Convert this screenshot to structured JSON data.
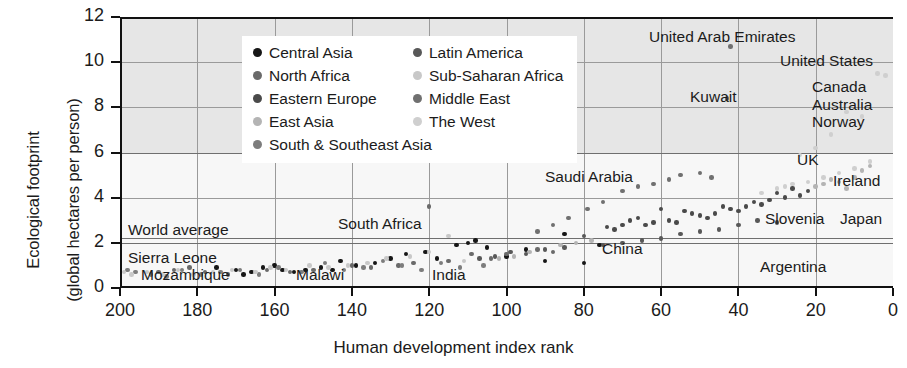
{
  "chart_data": {
    "type": "scatter",
    "title": "",
    "xlabel": "Human development index rank",
    "ylabel": "Ecological footprint\n(global hectares per person)",
    "ylabel_line1": "Ecological footprint",
    "ylabel_line2": "(global hectares per person)",
    "xlim": [
      200,
      0
    ],
    "ylim": [
      0,
      12
    ],
    "x_reversed": true,
    "xticks": [
      200,
      180,
      160,
      140,
      120,
      100,
      80,
      60,
      40,
      20,
      0
    ],
    "yticks": [
      0,
      2,
      4,
      6,
      8,
      10,
      12
    ],
    "grid": "both",
    "legend_position": "top-left-inside",
    "shaded_band": {
      "from": 6,
      "to": 12,
      "color": "#e6e6e6"
    },
    "reference_lines": [
      {
        "label": "World average",
        "y": 2.2
      }
    ],
    "series": [
      {
        "name": "Central Asia",
        "color": "#161616",
        "points": [
          [
            110,
            2.0
          ],
          [
            113,
            1.9
          ],
          [
            126,
            1.5
          ],
          [
            130,
            1.3
          ],
          [
            139,
            1.0
          ],
          [
            143,
            1.2
          ],
          [
            148,
            0.9
          ],
          [
            152,
            0.8
          ],
          [
            158,
            0.8
          ],
          [
            163,
            0.9
          ],
          [
            166,
            0.7
          ],
          [
            170,
            0.8
          ],
          [
            175,
            0.9
          ],
          [
            118,
            1.3
          ],
          [
            121,
            1.6
          ],
          [
            134,
            1.1
          ],
          [
            145,
            0.8
          ],
          [
            155,
            0.7
          ],
          [
            160,
            1.0
          ],
          [
            168,
            0.6
          ],
          [
            108,
            2.1
          ],
          [
            105,
            1.8
          ],
          [
            100,
            1.4
          ],
          [
            95,
            1.7
          ],
          [
            90,
            1.2
          ],
          [
            85,
            2.4
          ],
          [
            80,
            1.1
          ],
          [
            76,
            1.9
          ]
        ]
      },
      {
        "name": "North Africa",
        "color": "#6a6a6a",
        "points": [
          [
            88,
            1.6
          ],
          [
            92,
            1.7
          ],
          [
            100,
            1.5
          ],
          [
            104,
            1.3
          ],
          [
            109,
            1.5
          ],
          [
            115,
            1.2
          ],
          [
            120,
            3.6
          ],
          [
            124,
            1.1
          ],
          [
            128,
            1.0
          ],
          [
            135,
            0.9
          ],
          [
            140,
            1.0
          ],
          [
            150,
            0.8
          ],
          [
            156,
            0.7
          ],
          [
            162,
            0.8
          ],
          [
            172,
            0.6
          ],
          [
            178,
            0.7
          ],
          [
            182,
            0.9
          ],
          [
            186,
            0.8
          ],
          [
            190,
            0.7
          ]
        ]
      },
      {
        "name": "Eastern Europe",
        "color": "#4a4a4a",
        "points": [
          [
            30,
            4.2
          ],
          [
            34,
            3.7
          ],
          [
            38,
            3.6
          ],
          [
            42,
            3.5
          ],
          [
            46,
            3.3
          ],
          [
            50,
            3.2
          ],
          [
            54,
            3.4
          ],
          [
            58,
            3.0
          ],
          [
            62,
            2.9
          ],
          [
            66,
            3.1
          ],
          [
            70,
            2.8
          ],
          [
            74,
            2.7
          ],
          [
            28,
            4.0
          ],
          [
            32,
            3.9
          ],
          [
            36,
            3.8
          ],
          [
            40,
            3.4
          ],
          [
            44,
            3.6
          ],
          [
            48,
            3.1
          ],
          [
            52,
            3.3
          ],
          [
            56,
            2.9
          ],
          [
            60,
            3.5
          ],
          [
            64,
            2.8
          ],
          [
            68,
            3.0
          ],
          [
            72,
            2.6
          ],
          [
            26,
            4.4
          ],
          [
            24,
            4.1
          ],
          [
            22,
            4.3
          ]
        ]
      },
      {
        "name": "East Asia",
        "color": "#b4b4b4",
        "points": [
          [
            10,
            4.9
          ],
          [
            14,
            4.7
          ],
          [
            18,
            4.6
          ],
          [
            8,
            5.2
          ],
          [
            12,
            4.4
          ],
          [
            16,
            4.8
          ],
          [
            20,
            4.5
          ],
          [
            6,
            5.4
          ],
          [
            78,
            2.1
          ],
          [
            82,
            2.0
          ],
          [
            86,
            1.9
          ],
          [
            94,
            1.6
          ],
          [
            98,
            1.4
          ],
          [
            102,
            1.3
          ]
        ]
      },
      {
        "name": "South & Southeast Asia",
        "color": "#7d7d7d",
        "points": [
          [
            106,
            1.0
          ],
          [
            112,
            0.9
          ],
          [
            117,
            1.1
          ],
          [
            122,
            0.8
          ],
          [
            127,
            1.0
          ],
          [
            132,
            1.2
          ],
          [
            137,
            0.9
          ],
          [
            142,
            0.8
          ],
          [
            147,
            1.1
          ],
          [
            153,
            0.7
          ],
          [
            159,
            0.9
          ],
          [
            164,
            0.6
          ],
          [
            169,
            0.8
          ],
          [
            174,
            0.7
          ],
          [
            179,
            0.6
          ],
          [
            184,
            0.8
          ],
          [
            188,
            0.5
          ],
          [
            192,
            0.6
          ],
          [
            196,
            0.7
          ],
          [
            198,
            0.8
          ]
        ]
      },
      {
        "name": "Latin America",
        "color": "#585858",
        "points": [
          [
            45,
            2.6
          ],
          [
            50,
            2.5
          ],
          [
            55,
            2.4
          ],
          [
            60,
            2.2
          ],
          [
            65,
            2.1
          ],
          [
            70,
            2.0
          ],
          [
            75,
            1.9
          ],
          [
            80,
            2.3
          ],
          [
            85,
            1.8
          ],
          [
            90,
            1.7
          ],
          [
            95,
            1.5
          ],
          [
            40,
            2.8
          ],
          [
            35,
            3.0
          ],
          [
            30,
            2.9
          ],
          [
            99,
            1.6
          ],
          [
            103,
            1.4
          ],
          [
            107,
            1.3
          ]
        ]
      },
      {
        "name": "Sub-Saharan Africa",
        "color": "#c8c8c8",
        "points": [
          [
            125,
            1.4
          ],
          [
            131,
            1.3
          ],
          [
            136,
            1.1
          ],
          [
            141,
            1.0
          ],
          [
            146,
            0.9
          ],
          [
            151,
            1.0
          ],
          [
            157,
            0.8
          ],
          [
            161,
            0.9
          ],
          [
            165,
            0.7
          ],
          [
            171,
            0.8
          ],
          [
            176,
            0.7
          ],
          [
            181,
            0.6
          ],
          [
            185,
            0.8
          ],
          [
            189,
            0.6
          ],
          [
            193,
            0.7
          ],
          [
            197,
            0.6
          ],
          [
            199,
            0.7
          ],
          [
            120,
            1.6
          ],
          [
            115,
            2.3
          ],
          [
            111,
            1.2
          ]
        ]
      },
      {
        "name": "Middle East",
        "color": "#707070",
        "points": [
          [
            42,
            10.7
          ],
          [
            43,
            8.4
          ],
          [
            55,
            5.0
          ],
          [
            62,
            4.6
          ],
          [
            66,
            4.5
          ],
          [
            70,
            4.3
          ],
          [
            75,
            3.8
          ],
          [
            79,
            3.5
          ],
          [
            84,
            3.1
          ],
          [
            88,
            2.8
          ],
          [
            92,
            2.5
          ],
          [
            58,
            4.8
          ],
          [
            50,
            5.1
          ],
          [
            47,
            4.9
          ]
        ]
      },
      {
        "name": "The West",
        "color": "#cfcfcf",
        "points": [
          [
            4,
            9.5
          ],
          [
            12,
            7.8
          ],
          [
            8,
            7.6
          ],
          [
            16,
            6.8
          ],
          [
            20,
            6.2
          ],
          [
            24,
            5.9
          ],
          [
            6,
            5.6
          ],
          [
            10,
            5.3
          ],
          [
            14,
            5.1
          ],
          [
            18,
            4.9
          ],
          [
            22,
            4.7
          ],
          [
            26,
            4.6
          ],
          [
            2,
            9.4
          ],
          [
            28,
            4.5
          ],
          [
            30,
            4.4
          ],
          [
            34,
            4.2
          ]
        ]
      }
    ],
    "annotations": [
      {
        "label": "United Arab Emirates",
        "x_px": 649,
        "y_px": 28,
        "align": "left"
      },
      {
        "label": "United States",
        "x_px": 780,
        "y_px": 52,
        "align": "left"
      },
      {
        "label": "Kuwait",
        "x_px": 690,
        "y_px": 88,
        "align": "left"
      },
      {
        "label": "Canada",
        "x_px": 812,
        "y_px": 78,
        "align": "left"
      },
      {
        "label": "Australia",
        "x_px": 812,
        "y_px": 96,
        "align": "left"
      },
      {
        "label": "Norway",
        "x_px": 812,
        "y_px": 113,
        "align": "left"
      },
      {
        "label": "UK",
        "x_px": 797,
        "y_px": 151,
        "align": "left"
      },
      {
        "label": "Ireland",
        "x_px": 833,
        "y_px": 172,
        "align": "left"
      },
      {
        "label": "Saudi Arabia",
        "x_px": 545,
        "y_px": 168,
        "align": "left"
      },
      {
        "label": "Slovenia",
        "x_px": 765,
        "y_px": 210,
        "align": "left"
      },
      {
        "label": "Japan",
        "x_px": 840,
        "y_px": 210,
        "align": "left"
      },
      {
        "label": "South Africa",
        "x_px": 338,
        "y_px": 215,
        "align": "left"
      },
      {
        "label": "World average",
        "x_px": 128,
        "y_px": 221,
        "align": "left"
      },
      {
        "label": "China",
        "x_px": 602,
        "y_px": 240,
        "align": "left"
      },
      {
        "label": "Argentina",
        "x_px": 760,
        "y_px": 258,
        "align": "left"
      },
      {
        "label": "Sierra Leone",
        "x_px": 128,
        "y_px": 249,
        "align": "left"
      },
      {
        "label": "Mozambique",
        "x_px": 141,
        "y_px": 266,
        "align": "left"
      },
      {
        "label": "Malawi",
        "x_px": 296,
        "y_px": 266,
        "align": "left"
      },
      {
        "label": "India",
        "x_px": 432,
        "y_px": 266,
        "align": "left"
      }
    ]
  },
  "axes": {
    "y_title_line1": "Ecological footprint",
    "y_title_line2": "(global hectares per person)",
    "x_title": "Human development index rank",
    "y_ticks": [
      "12",
      "10",
      "8",
      "6",
      "4",
      "2",
      "0"
    ],
    "x_ticks": [
      "200",
      "180",
      "160",
      "140",
      "120",
      "100",
      "80",
      "60",
      "40",
      "20",
      "0"
    ]
  },
  "legend": {
    "column1": [
      {
        "label": "Central Asia",
        "color": "#161616"
      },
      {
        "label": "North Africa",
        "color": "#6a6a6a"
      },
      {
        "label": "Eastern Europe",
        "color": "#4a4a4a"
      },
      {
        "label": "East Asia",
        "color": "#b4b4b4"
      }
    ],
    "column2": [
      {
        "label": "Latin America",
        "color": "#585858"
      },
      {
        "label": "Sub-Saharan Africa",
        "color": "#c8c8c8"
      },
      {
        "label": "Middle East",
        "color": "#707070"
      },
      {
        "label": "The West",
        "color": "#cfcfcf"
      }
    ],
    "full_width_row": {
      "label": "South & Southeast Asia",
      "color": "#7d7d7d"
    }
  }
}
